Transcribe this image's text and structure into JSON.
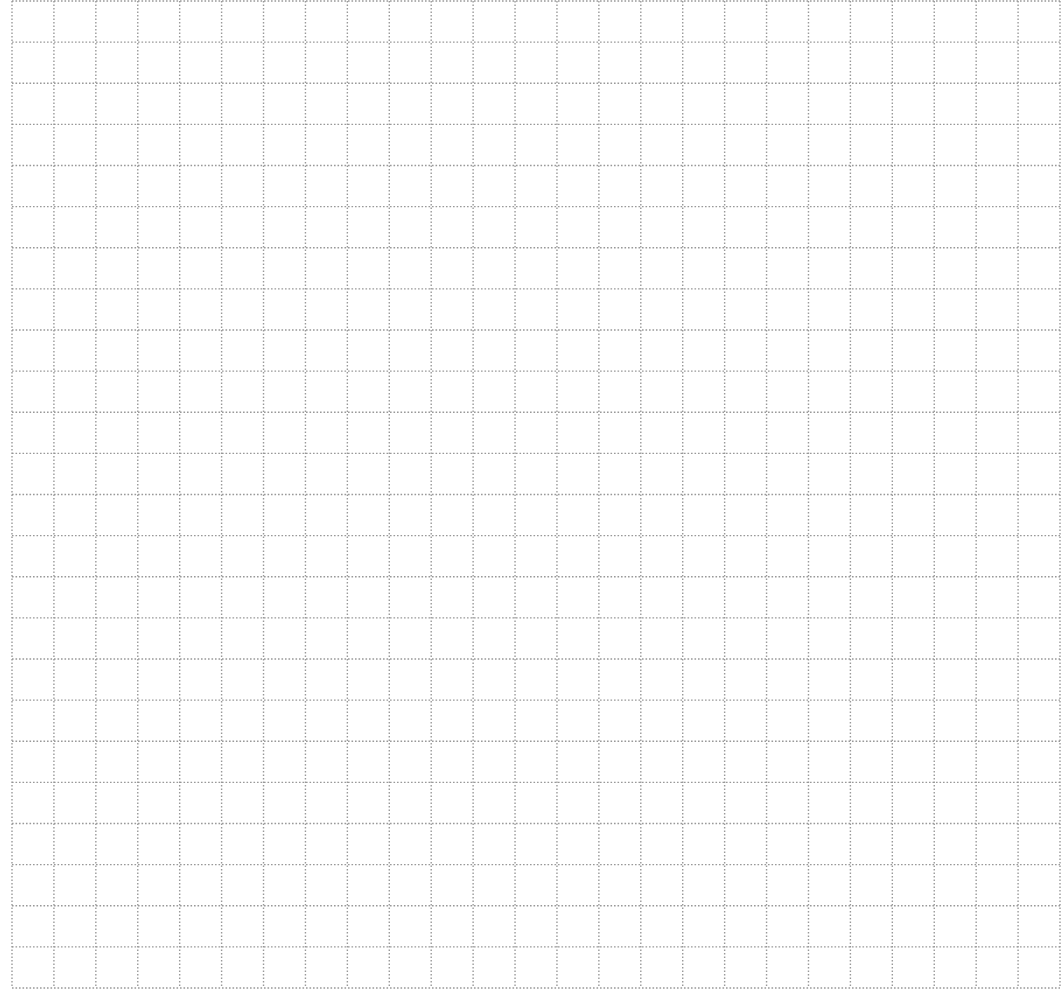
{
  "page": {
    "type": "grid-paper",
    "background_color": "#ffffff",
    "line_color": "#8e8e8e",
    "line_style": "dotted"
  },
  "grid": {
    "left": 12,
    "right": 1060,
    "top": 1,
    "bottom": 988,
    "columns": 25,
    "rows": 24
  }
}
